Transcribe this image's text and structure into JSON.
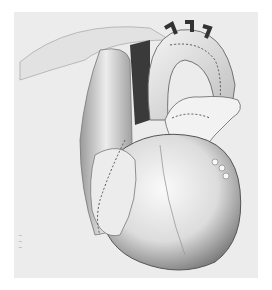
{
  "illustration": {
    "subject": "heart-surgical-illustration",
    "style": "pencil-stipple-drawing",
    "colors": {
      "background": "#ffffff",
      "frame": "#ececec",
      "shadow": "#3a3a3a",
      "highlight": "#f7f7f7"
    }
  },
  "signature": {
    "lines": [
      "~",
      "~",
      "~"
    ]
  }
}
